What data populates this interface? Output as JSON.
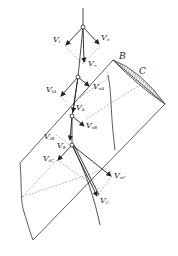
{
  "diagram": {
    "points": {
      "B": "B",
      "C": "C"
    },
    "vectors": {
      "v_t": {
        "base": "V",
        "sub": "t"
      },
      "v_n": {
        "base": "V",
        "sub": "n"
      },
      "v_inf": {
        "base": "V",
        "sub": "∞"
      },
      "v_tA": {
        "base": "V",
        "sub": "tA"
      },
      "v_nA": {
        "base": "V",
        "sub": "nA"
      },
      "v_A": {
        "base": "V",
        "sub": "A"
      },
      "v_tB": {
        "base": "V",
        "sub": "tB"
      },
      "v_nB": {
        "base": "V",
        "sub": "nB"
      },
      "v_B": {
        "base": "V",
        "sub": "B"
      },
      "v_tC": {
        "base": "V",
        "sub": "tC"
      },
      "v_nC": {
        "base": "V",
        "sub": "nC"
      },
      "v_C": {
        "base": "V",
        "sub": "C"
      }
    },
    "colors": {
      "line": "#333333",
      "dashed": "#888888",
      "hatch": "#444444"
    }
  }
}
